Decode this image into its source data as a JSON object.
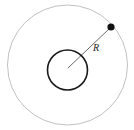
{
  "figure": {
    "canvas": {
      "width": 134,
      "height": 130,
      "background": "#ffffff"
    },
    "outer_circle": {
      "name": "orbit path",
      "cx": 67.5,
      "cy": 65,
      "r": 60,
      "stroke": "#b9b9b9",
      "stroke_width": 0.9,
      "fill": "none"
    },
    "inner_circle": {
      "name": "central body",
      "cx": 67.5,
      "cy": 70,
      "r": 20,
      "stroke": "#1a1a1a",
      "stroke_width": 1.6,
      "fill": "none"
    },
    "radius_line": {
      "name": "radius leader line",
      "x1": 68,
      "y1": 68,
      "x2": 109,
      "y2": 29,
      "stroke": "#5a5a5a",
      "stroke_width": 0.9
    },
    "orbiting_dot": {
      "name": "orbiting point mass",
      "cx": 111,
      "cy": 27,
      "r": 3.6,
      "fill": "#111111"
    },
    "radius_label": {
      "text": "R",
      "x": 96,
      "y": 51,
      "color": "#1a1a1a",
      "font_size": 10,
      "style": "italic"
    }
  }
}
